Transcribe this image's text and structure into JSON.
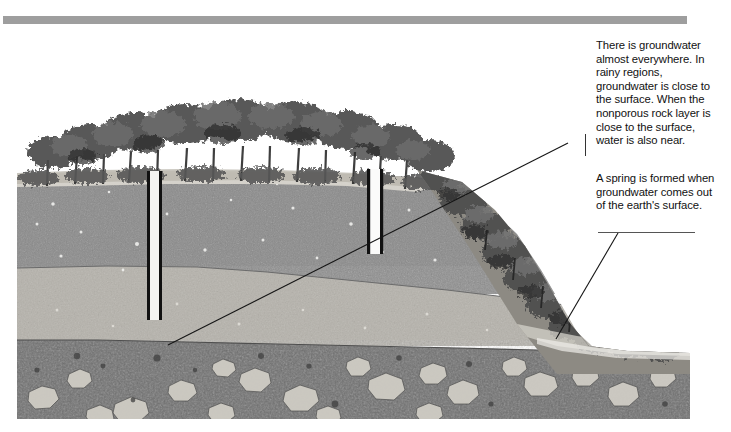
{
  "page": {
    "background": "#ffffff"
  },
  "header": {
    "bar_color": "#9e9e9e"
  },
  "illustration": {
    "name": "groundwater-cross-section",
    "description": "Cross-section of a hillside showing tree-covered ridge, porous soil layers, two wells drilled down to groundwater, and a spring emerging at the slope base.",
    "sky_color": "#ffffff",
    "layers": [
      {
        "name": "topsoil-vegetation",
        "label": "Tree-covered surface soil",
        "color": "#8f8c86"
      },
      {
        "name": "upper-porous-layer",
        "label": "Upper porous rock layer",
        "color": "#8a8a8a"
      },
      {
        "name": "saturated-layer",
        "label": "Groundwater-saturated layer",
        "color": "#b5b2ab"
      },
      {
        "name": "nonporous-rock-layer",
        "label": "Nonporous rock layer",
        "color": "#6e6e6e"
      }
    ],
    "wells": [
      {
        "name": "well-left",
        "x": 131,
        "top": 97,
        "bottom": 246,
        "width": 13
      },
      {
        "name": "well-right",
        "x": 351,
        "top": 95,
        "bottom": 180,
        "width": 14
      }
    ],
    "spring_point": {
      "x": 538,
      "y": 267
    }
  },
  "annotations": {
    "note_1": {
      "name": "groundwater-note",
      "text": "There is groundwater almost everywhere. In rainy regions, groundwater is close to the surface. When the nonporous rock layer is close to the surface, water is also near."
    },
    "note_2": {
      "name": "spring-note",
      "text": "A spring is formed when groundwater comes out of the earth's surface."
    },
    "leader_lines": [
      {
        "name": "leader-line-groundwater",
        "from": [
          568,
          143
        ],
        "to": [
          168,
          345
        ]
      },
      {
        "name": "leader-line-spring",
        "from": [
          618,
          233
        ],
        "to": [
          556,
          339
        ]
      }
    ]
  }
}
